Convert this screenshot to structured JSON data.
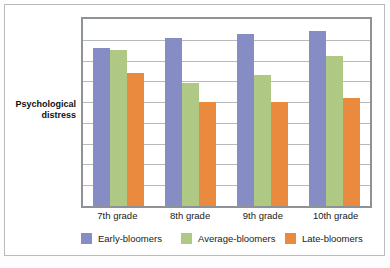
{
  "chart_data": {
    "type": "bar",
    "title": "",
    "subtitle": "",
    "xlabel": "",
    "ylabel": "Psychological distress",
    "categories": [
      "7th grade",
      "8th grade",
      "9th grade",
      "10th grade"
    ],
    "series": [
      {
        "name": "Early-bloomers",
        "color": "#868cc4",
        "values": [
          7.6,
          8.1,
          8.3,
          8.4
        ]
      },
      {
        "name": "Average-bloomers",
        "color": "#afc984",
        "values": [
          7.5,
          5.9,
          6.3,
          7.2
        ]
      },
      {
        "name": "Late-bloomers",
        "color": "#ea8a3e",
        "values": [
          6.4,
          5.0,
          5.0,
          5.2
        ]
      }
    ],
    "ylim": [
      0,
      9
    ],
    "y_tick_values": [
      1,
      2,
      3,
      4,
      5,
      6,
      7,
      8
    ],
    "y_tick_labels_visible": false,
    "gridlines": {
      "horizontal": true,
      "vertical": false,
      "count": 8,
      "color": "#b6babd"
    },
    "legend": {
      "position": "bottom",
      "orientation": "horizontal"
    },
    "axis_frame_color": "#8d9296",
    "plot_background": "#ffffff",
    "figure_border_color": "#b9bcbe"
  },
  "ylabel_lines": [
    "Psychological",
    "distress"
  ],
  "legend_entries": [
    {
      "label": "Early-bloomers",
      "color": "#868cc4"
    },
    {
      "label": "Average-bloomers",
      "color": "#afc984"
    },
    {
      "label": "Late-bloomers",
      "color": "#ea8a3e"
    }
  ]
}
